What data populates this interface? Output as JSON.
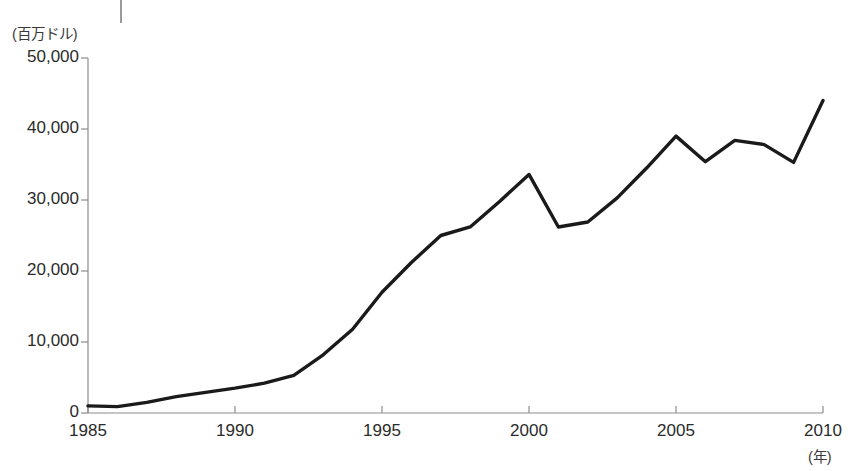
{
  "chart_data": {
    "type": "line",
    "title": "",
    "xlabel": "(年)",
    "ylabel": "(百万ドル)",
    "xlim": [
      1985,
      2010
    ],
    "ylim": [
      0,
      50000
    ],
    "grid": false,
    "legend": null,
    "x": [
      1985,
      1986,
      1987,
      1988,
      1989,
      1990,
      1991,
      1992,
      1993,
      1994,
      1995,
      1996,
      1997,
      1998,
      1999,
      2000,
      2001,
      2002,
      2003,
      2004,
      2005,
      2006,
      2007,
      2008,
      2009,
      2010
    ],
    "values": [
      1000,
      900,
      1500,
      2300,
      2900,
      3500,
      4200,
      5300,
      8200,
      11800,
      17000,
      21200,
      25000,
      26200,
      29800,
      33600,
      26200,
      26900,
      30300,
      34500,
      39000,
      35400,
      38400,
      37800,
      35300,
      44000
    ],
    "xticks": [
      1985,
      1990,
      1995,
      2000,
      2005,
      2010
    ],
    "xtick_labels": [
      "1985",
      "1990",
      "1995",
      "2000",
      "2005",
      "2010"
    ],
    "yticks": [
      0,
      10000,
      20000,
      30000,
      40000,
      50000
    ],
    "ytick_labels": [
      "0",
      "10,000",
      "20,000",
      "30,000",
      "40,000",
      "50,000"
    ],
    "line_color": "#1a1a1a",
    "axis_color": "#8d8d8d"
  }
}
